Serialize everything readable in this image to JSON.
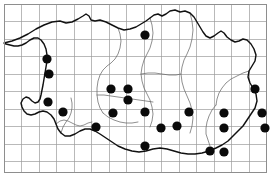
{
  "figure": {
    "background_color": "#ffffff",
    "frame_color": "#8e8e8e",
    "grid_color": "#9b9b9b",
    "coastline_color": "#111111",
    "inner_boundary_color": "#6a6a6a",
    "dot_color": "#0a0a0a",
    "dot_radius": 4.6,
    "record_count": 22
  },
  "grid": {
    "spacing_px": 17.5,
    "columns": 15,
    "rows": 10,
    "frame": {
      "x": 4,
      "y": 4,
      "width": 262,
      "height": 168
    }
  },
  "chart_data": {
    "type": "scatter",
    "xlabel": "",
    "ylabel": "",
    "xlim": [
      4,
      266
    ],
    "ylim": [
      172,
      4
    ],
    "grid": true,
    "legend": "none",
    "series": [
      {
        "name": "Records",
        "marker": "filled-circle",
        "color": "#0a0a0a",
        "points": [
          [
            47,
            59
          ],
          [
            49,
            74
          ],
          [
            48,
            102
          ],
          [
            63,
            112
          ],
          [
            145,
            35
          ],
          [
            111,
            89
          ],
          [
            128,
            89
          ],
          [
            128,
            100
          ],
          [
            113,
            113
          ],
          [
            145,
            112
          ],
          [
            96,
            127
          ],
          [
            161,
            128
          ],
          [
            177,
            126
          ],
          [
            145,
            146
          ],
          [
            189,
            112
          ],
          [
            224,
            113
          ],
          [
            224,
            128
          ],
          [
            210,
            151
          ],
          [
            224,
            152
          ],
          [
            255,
            89
          ],
          [
            262,
            113
          ],
          [
            265,
            128
          ]
        ]
      }
    ]
  },
  "geometry": {
    "coastline": "M 4 43 L 12 41 L 20 38 L 28 34 L 36 29 L 44 25 L 52 22 L 60 21 L 66 23 L 72 22 L 78 19 L 83 16 L 86 14 L 89 16 L 91 20 L 95 21 L 100 20 L 106 22 L 112 25 L 118 28 L 124 30 L 130 29 L 136 27 L 141 24 L 146 21 L 150 18 L 154 15 L 158 14 L 162 16 L 166 14 L 170 11 L 175 10 L 180 12 L 185 11 L 190 13 L 194 17 L 197 22 L 200 27 L 203 32 L 206 36 L 210 38 L 214 36 L 218 33 L 221 31 L 224 33 L 227 37 L 231 40 L 235 42 L 239 41 L 243 39 L 247 40 L 251 44 L 254 49 L 256 55 L 255 61 L 252 66 L 249 71 L 248 77 L 250 83 L 253 88 L 256 94 L 257 101 L 255 108 L 251 114 L 247 120 L 243 126 L 238 131 L 233 136 L 228 141 L 222 145 L 216 148 L 209 151 L 202 153 L 195 154 L 188 154 L 181 153 L 174 151 L 167 149 L 160 148 L 153 149 L 146 151 L 139 152 L 132 151 L 125 149 L 118 146 L 112 142 L 106 138 L 100 134 L 95 131 L 90 129 L 85 129 L 80 131 L 75 134 L 70 136 L 65 136 L 61 133 L 58 129 L 56 124 L 54 119 L 51 115 L 47 112 L 43 111 L 39 112 L 35 114 L 31 115 L 27 114 L 24 111 L 22 107 L 21 103 L 23 99 L 26 97 L 29 98 L 32 101 L 35 103 L 38 102 L 40 99 L 41 95 L 42 90 L 43 85 L 44 79 L 45 73 L 46 67 L 47 61 L 47 55 L 46 49 L 44 44 L 41 40 L 38 38 L 34 38 L 30 40 L 26 43 L 22 45 L 18 46 L 14 46 L 10 45 L 6 44 Z",
    "inner_boundaries": [
      "M 118 28 L 120 34 L 121 41 L 120 48 L 118 54 L 115 59 L 111 63 L 107 66 L 103 70 L 100 75 L 98 81 L 97 88 L 97 95 L 98 102 L 100 108 L 103 113",
      "M 150 18 L 152 25 L 153 33 L 152 41 L 150 48 L 147 54 L 144 60 L 142 67 L 141 74 L 142 81 L 144 88 L 147 94 L 150 100 L 152 107 L 153 114 L 152 121 L 150 127",
      "M 190 13 L 192 21 L 193 30 L 192 39 L 190 47 L 187 54 L 184 60 L 182 67 L 181 74 L 182 82 L 184 89 L 187 96 L 190 103 L 192 110 L 193 118 L 192 126 L 190 133",
      "M 56 124 L 60 121 L 64 120 L 68 121 L 72 123 L 76 125 L 80 126 L 84 125 L 88 123 L 92 122",
      "M 97 95 L 104 95 L 111 96 L 118 97 L 125 98 L 132 99 L 139 100 L 146 101 L 153 102",
      "M 141 74 L 148 73 L 155 73 L 162 74 L 169 75 L 176 75 L 181 74",
      "M 249 71 L 243 73 L 237 76 L 231 79 L 226 83 L 222 88 L 219 93 L 217 99 L 216 105",
      "M 61 133 L 63 127 L 66 122 L 69 118 L 71 113 L 72 108 L 72 103 L 71 98",
      "M 103 113 L 108 117 L 114 120 L 120 122 L 126 123 L 132 123 L 138 122",
      "M 216 105 L 212 110 L 209 116 L 207 122 L 206 128 L 206 134 L 208 140 L 210 146"
    ]
  }
}
